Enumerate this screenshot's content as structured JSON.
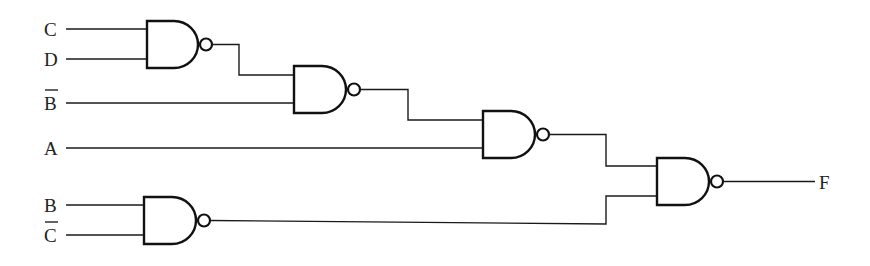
{
  "diagram": {
    "type": "logic-circuit",
    "gate_type": "NAND",
    "colors": {
      "stroke": "#111111",
      "background": "#ffffff",
      "text": "#222222"
    },
    "inputs": [
      {
        "id": "in-c",
        "label": "C",
        "overbar": false,
        "y": 29
      },
      {
        "id": "in-d",
        "label": "D",
        "overbar": false,
        "y": 59
      },
      {
        "id": "in-bbar",
        "label": "B",
        "overbar": true,
        "y": 103
      },
      {
        "id": "in-a",
        "label": "A",
        "overbar": false,
        "y": 148
      },
      {
        "id": "in-b",
        "label": "B",
        "overbar": false,
        "y": 205
      },
      {
        "id": "in-cbar",
        "label": "C",
        "overbar": true,
        "y": 235
      }
    ],
    "output": {
      "label": "F"
    },
    "gates": [
      {
        "id": "nand1",
        "inputs": [
          "C",
          "D"
        ]
      },
      {
        "id": "nand2",
        "inputs": [
          "nand1",
          "B̄"
        ]
      },
      {
        "id": "nand3",
        "inputs": [
          "nand2",
          "A"
        ]
      },
      {
        "id": "nand4",
        "inputs": [
          "nand3",
          "nand5"
        ],
        "output": "F"
      },
      {
        "id": "nand5",
        "inputs": [
          "B",
          "C̄"
        ]
      }
    ]
  }
}
